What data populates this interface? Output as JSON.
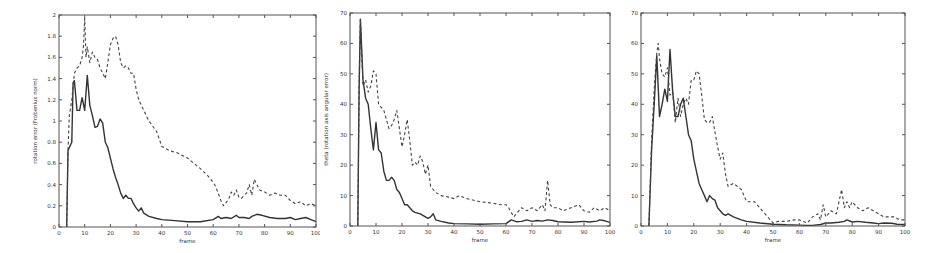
{
  "chart_data": [
    {
      "type": "line",
      "title": "",
      "xlabel": "frame",
      "ylabel": "rotation error (Frobenius norm)",
      "xlim": [
        0,
        100
      ],
      "ylim": [
        0,
        2
      ],
      "xticks": [
        0,
        10,
        20,
        30,
        40,
        50,
        60,
        70,
        80,
        90,
        100
      ],
      "yticks": [
        0,
        0.2,
        0.4,
        0.6,
        0.8,
        1,
        1.2,
        1.4,
        1.6,
        1.8,
        2
      ],
      "ytick_labels": [
        "0",
        "0.2",
        "0.4",
        "0.6",
        "0.8",
        "1",
        "1.2",
        "1.4",
        "1.6",
        "1.8",
        "2"
      ],
      "grid": false,
      "legend": null,
      "series": [
        {
          "name": "solid",
          "style": "solid",
          "x": [
            3,
            3.5,
            4,
            5,
            5.5,
            6,
            7,
            8,
            9,
            10,
            11,
            12,
            13,
            14,
            15,
            16,
            17,
            18,
            19,
            20,
            21,
            22,
            23,
            24,
            25,
            26,
            27,
            28,
            29,
            30,
            31,
            32,
            33,
            35,
            38,
            40,
            45,
            50,
            55,
            60,
            62,
            63,
            65,
            67,
            69,
            70,
            72,
            74,
            75,
            77,
            79,
            82,
            85,
            88,
            90,
            92,
            94,
            96,
            98,
            100
          ],
          "y": [
            0,
            0.72,
            0.75,
            0.8,
            1.36,
            1.38,
            1.1,
            1.1,
            1.22,
            1.1,
            1.43,
            1.15,
            1.05,
            0.94,
            0.95,
            1.02,
            0.98,
            0.8,
            0.75,
            0.65,
            0.55,
            0.47,
            0.4,
            0.32,
            0.27,
            0.3,
            0.27,
            0.27,
            0.22,
            0.18,
            0.15,
            0.18,
            0.13,
            0.1,
            0.08,
            0.07,
            0.06,
            0.05,
            0.05,
            0.07,
            0.1,
            0.08,
            0.09,
            0.08,
            0.11,
            0.09,
            0.09,
            0.08,
            0.1,
            0.12,
            0.11,
            0.09,
            0.08,
            0.08,
            0.09,
            0.07,
            0.08,
            0.09,
            0.07,
            0.05
          ]
        },
        {
          "name": "dashed",
          "style": "dashed",
          "x": [
            3,
            3.5,
            4,
            5,
            6,
            7,
            8,
            9,
            9.5,
            10,
            10.5,
            11,
            12,
            13,
            14,
            15,
            16,
            17,
            18,
            19,
            20,
            21,
            22,
            23,
            24,
            25,
            26,
            27,
            28,
            29,
            30,
            31,
            33,
            35,
            38,
            40,
            43,
            46,
            50,
            55,
            58,
            60,
            61,
            63,
            64,
            66,
            67,
            68,
            69,
            70,
            71,
            72,
            73,
            74,
            75,
            76,
            77,
            78,
            80,
            82,
            84,
            86,
            88,
            90,
            92,
            94,
            96,
            98,
            100
          ],
          "y": [
            0,
            0.72,
            1.05,
            1.2,
            1.45,
            1.5,
            1.52,
            1.6,
            1.7,
            1.97,
            1.6,
            1.7,
            1.55,
            1.65,
            1.6,
            1.58,
            1.5,
            1.45,
            1.4,
            1.55,
            1.72,
            1.78,
            1.8,
            1.72,
            1.55,
            1.5,
            1.52,
            1.5,
            1.45,
            1.45,
            1.3,
            1.2,
            1.1,
            1.0,
            0.9,
            0.76,
            0.72,
            0.7,
            0.65,
            0.55,
            0.48,
            0.42,
            0.38,
            0.25,
            0.2,
            0.26,
            0.33,
            0.3,
            0.35,
            0.28,
            0.27,
            0.3,
            0.32,
            0.4,
            0.3,
            0.45,
            0.4,
            0.35,
            0.33,
            0.3,
            0.32,
            0.3,
            0.3,
            0.25,
            0.22,
            0.24,
            0.2,
            0.22,
            0.2
          ]
        }
      ]
    },
    {
      "type": "line",
      "title": "",
      "xlabel": "frame",
      "ylabel": "theta (rotation axis angular error)",
      "xlim": [
        0,
        100
      ],
      "ylim": [
        0,
        70
      ],
      "xticks": [
        0,
        10,
        20,
        30,
        40,
        50,
        60,
        70,
        80,
        90,
        100
      ],
      "yticks": [
        0,
        10,
        20,
        30,
        40,
        50,
        60,
        70
      ],
      "ytick_labels": [
        "0",
        "10",
        "20",
        "30",
        "40",
        "50",
        "60",
        "70"
      ],
      "grid": false,
      "legend": null,
      "series": [
        {
          "name": "solid",
          "style": "solid",
          "x": [
            3,
            3.5,
            4,
            5,
            6,
            7,
            8,
            9,
            10,
            11,
            12,
            13,
            14,
            15,
            16,
            17,
            18,
            19,
            20,
            21,
            22,
            23,
            24,
            25,
            27,
            29,
            30,
            31,
            32,
            33,
            35,
            38,
            40,
            45,
            50,
            55,
            60,
            62,
            64,
            66,
            68,
            70,
            72,
            74,
            76,
            78,
            80,
            85,
            90,
            92,
            95,
            96,
            98,
            100
          ],
          "y": [
            0,
            45,
            68,
            48,
            42,
            40,
            32,
            25,
            34,
            25,
            24,
            18,
            15,
            15,
            16,
            15,
            12,
            11,
            9,
            7,
            7,
            6,
            5,
            4.5,
            4,
            3,
            2.5,
            3,
            4,
            2,
            1.5,
            1,
            0.8,
            0.7,
            0.6,
            0.7,
            0.8,
            2,
            1.4,
            1.5,
            2,
            1.5,
            1.8,
            1.6,
            2,
            1.8,
            1.4,
            1.2,
            1.5,
            1.3,
            1.6,
            2,
            1.7,
            1.2
          ]
        },
        {
          "name": "dashed",
          "style": "dashed",
          "x": [
            3,
            3.5,
            4,
            5,
            6,
            7,
            8,
            9,
            10,
            11,
            12,
            13,
            14,
            15,
            16,
            17,
            18,
            19,
            20,
            21,
            22,
            23,
            24,
            25,
            26,
            27,
            28,
            29,
            30,
            31,
            32,
            33,
            35,
            38,
            40,
            42,
            45,
            50,
            55,
            58,
            60,
            61,
            63,
            64,
            66,
            68,
            70,
            72,
            74,
            75,
            76,
            77,
            78,
            80,
            82,
            85,
            88,
            90,
            92,
            94,
            96,
            98,
            100
          ],
          "y": [
            0,
            45,
            68,
            46,
            48,
            44,
            46,
            51,
            50,
            40,
            39,
            38,
            35,
            32,
            33,
            35,
            38,
            32,
            26,
            30,
            35,
            28,
            20,
            21,
            20,
            23,
            21,
            17,
            20,
            13,
            12,
            11,
            10,
            9.5,
            9,
            10,
            9,
            8,
            7.5,
            7,
            7,
            6,
            3,
            4,
            6,
            5,
            6,
            5,
            7,
            5,
            15,
            7,
            6,
            6,
            5,
            6,
            7,
            5,
            4.5,
            6,
            5,
            6,
            5
          ]
        }
      ]
    },
    {
      "type": "line",
      "title": "",
      "xlabel": "frame",
      "ylabel": "phi (rotation angular error)",
      "xlim": [
        0,
        100
      ],
      "ylim": [
        0,
        70
      ],
      "xticks": [
        0,
        10,
        20,
        30,
        40,
        50,
        60,
        70,
        80,
        90,
        100
      ],
      "yticks": [
        0,
        10,
        20,
        30,
        40,
        50,
        60,
        70
      ],
      "ytick_labels": [
        "0",
        "10",
        "20",
        "30",
        "40",
        "50",
        "60",
        "70"
      ],
      "grid": false,
      "legend": null,
      "series": [
        {
          "name": "solid",
          "style": "solid",
          "x": [
            3,
            4,
            5,
            6,
            7,
            8,
            9,
            10,
            11,
            12,
            13,
            14,
            15,
            16,
            17,
            18,
            19,
            20,
            21,
            22,
            23,
            24,
            25,
            26,
            27,
            28,
            29,
            30,
            31,
            32,
            33,
            35,
            38,
            40,
            45,
            50,
            55,
            60,
            63,
            65,
            68,
            70,
            72,
            75,
            77,
            78,
            80,
            82,
            85,
            88,
            90,
            92,
            95,
            97,
            100
          ],
          "y": [
            0,
            25,
            40,
            56,
            36,
            40,
            45,
            41,
            58,
            44,
            36,
            36,
            40,
            42,
            36,
            30,
            28,
            22,
            18,
            14,
            12,
            10,
            8,
            10,
            9,
            8.5,
            6,
            5,
            4,
            3.5,
            4,
            3,
            2,
            1.5,
            1,
            0.6,
            0.4,
            0.3,
            0.2,
            0.2,
            0.5,
            1,
            1,
            1.2,
            1.5,
            2,
            1.3,
            1.5,
            1.2,
            1,
            0.8,
            1,
            0.9,
            0.6,
            0.5
          ]
        },
        {
          "name": "dashed",
          "style": "dashed",
          "x": [
            3,
            4,
            5,
            6,
            6.5,
            7,
            8,
            9,
            10,
            11,
            12,
            13,
            14,
            15,
            16,
            17,
            18,
            19,
            20,
            21,
            22,
            23,
            24,
            25,
            26,
            27,
            28,
            29,
            30,
            31,
            32,
            33,
            35,
            38,
            40,
            43,
            46,
            50,
            52,
            55,
            58,
            60,
            63,
            65,
            67,
            68,
            69,
            70,
            72,
            74,
            75,
            76,
            77,
            78,
            79,
            80,
            82,
            84,
            86,
            88,
            90,
            92,
            94,
            96,
            98,
            100
          ],
          "y": [
            0,
            28,
            45,
            57,
            60,
            55,
            50,
            49,
            52,
            43,
            44,
            34,
            42,
            36,
            40,
            42,
            40,
            48,
            48,
            51,
            50,
            43,
            35,
            34,
            34,
            36,
            31,
            26,
            22,
            24,
            17,
            13,
            14,
            12,
            8,
            8,
            5,
            1,
            1.5,
            1.5,
            2,
            2,
            1,
            3,
            4,
            2,
            7,
            3,
            5,
            4,
            8,
            12,
            6,
            8,
            6,
            8,
            6,
            5,
            6,
            5,
            4,
            3,
            3,
            3,
            2,
            2
          ]
        }
      ]
    }
  ]
}
